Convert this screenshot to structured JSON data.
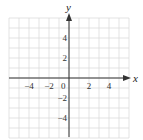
{
  "chart_data": {
    "type": "scatter",
    "title": "",
    "xlabel": "x",
    "ylabel": "y",
    "xlim": [
      -6,
      6
    ],
    "ylim": [
      -6,
      6
    ],
    "grid": true,
    "grid_step": 1,
    "x_ticks": [
      -4,
      -2,
      0,
      2,
      4
    ],
    "y_ticks": [
      4,
      2,
      -2,
      -4
    ],
    "x_tick_labels": [
      "−4",
      "−2",
      "0",
      "2",
      "4"
    ],
    "y_tick_labels": [
      "4",
      "2",
      "−2",
      "−4"
    ],
    "series": []
  },
  "colors": {
    "grid": "#dcdcdc",
    "axis": "#333333"
  }
}
